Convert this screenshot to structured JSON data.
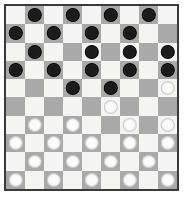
{
  "board": {
    "title": "Checkers Board",
    "columns": 9,
    "rows": 10,
    "colors": {
      "light_square": "#f4f4f2",
      "dark_square": "#a9a9a9",
      "black_piece": "#1b1b1b",
      "white_piece": "#fbfbfb",
      "border": "#3a3a3a",
      "background": "#ffffff"
    },
    "legend": {
      "black_piece_label": "black-piece",
      "white_piece_label": "white-piece",
      "empty_label": "empty-square"
    },
    "counts": {
      "black_pieces": 24,
      "white_pieces": 25
    },
    "squares": [
      [
        "empty",
        "black",
        "empty",
        "black",
        "empty",
        "black",
        "empty",
        "black",
        "empty"
      ],
      [
        "black",
        "empty",
        "black",
        "empty",
        "black",
        "empty",
        "black",
        "empty",
        "empty"
      ],
      [
        "empty",
        "black",
        "empty",
        "empty",
        "black",
        "empty",
        "black",
        "empty",
        "black"
      ],
      [
        "black",
        "empty",
        "black",
        "empty",
        "black",
        "empty",
        "black",
        "empty",
        "black"
      ],
      [
        "empty",
        "empty",
        "empty",
        "black",
        "empty",
        "black",
        "empty",
        "empty",
        "white"
      ],
      [
        "empty",
        "empty",
        "empty",
        "empty",
        "empty",
        "white",
        "empty",
        "empty",
        "empty"
      ],
      [
        "empty",
        "white",
        "empty",
        "white",
        "empty",
        "empty",
        "white",
        "empty",
        "white"
      ],
      [
        "white",
        "empty",
        "white",
        "empty",
        "white",
        "empty",
        "white",
        "empty",
        "white"
      ],
      [
        "empty",
        "white",
        "empty",
        "white",
        "empty",
        "white",
        "empty",
        "white",
        "empty"
      ],
      [
        "white",
        "empty",
        "white",
        "empty",
        "white",
        "empty",
        "white",
        "empty",
        "white"
      ]
    ]
  }
}
